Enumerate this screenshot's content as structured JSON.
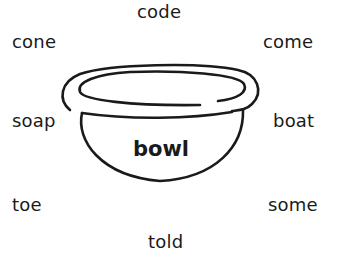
{
  "diagram": {
    "center": {
      "label": "bowl",
      "image": "bowl-drawing"
    },
    "words": [
      {
        "id": "code",
        "label": "code",
        "position": "top"
      },
      {
        "id": "cone",
        "label": "cone",
        "position": "top-left"
      },
      {
        "id": "come",
        "label": "come",
        "position": "top-right"
      },
      {
        "id": "soap",
        "label": "soap",
        "position": "left"
      },
      {
        "id": "boat",
        "label": "boat",
        "position": "right"
      },
      {
        "id": "toe",
        "label": "toe",
        "position": "bottom-left"
      },
      {
        "id": "some",
        "label": "some",
        "position": "bottom-right"
      },
      {
        "id": "told",
        "label": "told",
        "position": "bottom"
      }
    ]
  },
  "colors": {
    "ink": "#1a1a1a",
    "background": "#ffffff"
  }
}
